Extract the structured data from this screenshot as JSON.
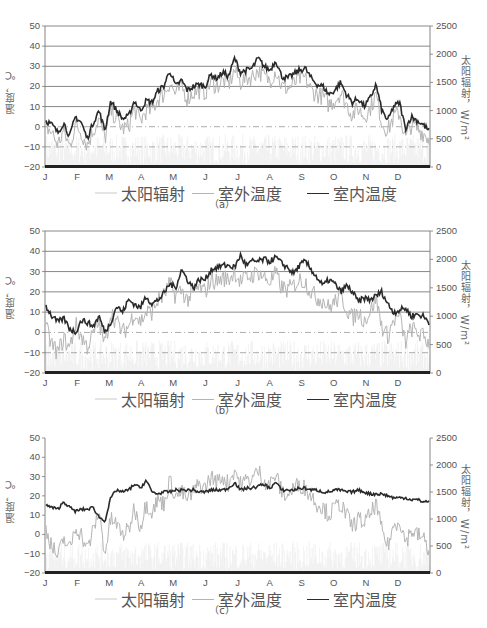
{
  "figure": {
    "months": [
      "J",
      "F",
      "M",
      "A",
      "M",
      "J",
      "J",
      "A",
      "S",
      "O",
      "N",
      "D"
    ],
    "left_axis": {
      "label": "温度，℃",
      "ticks": [
        "50",
        "40",
        "30",
        "20",
        "10",
        "0",
        "−10",
        "−20"
      ]
    },
    "right_axis": {
      "label": "太阳辐射，W/m²",
      "ticks": [
        "2500",
        "2000",
        "1500",
        "1000",
        "500",
        "0"
      ]
    },
    "legend": {
      "solar": "太阳辐射",
      "outdoor": "室外温度",
      "indoor": "室内温度"
    },
    "colors": {
      "solar": "#e4e4e4",
      "outdoor": "#b4b4b4",
      "indoor": "#2a2a2a",
      "grid": "#6a6a6a",
      "axis": "#777777"
    }
  },
  "panels": [
    {
      "caption": "（a）",
      "gridlines": true
    },
    {
      "caption": "（b）",
      "gridlines": true
    },
    {
      "caption": "（c）",
      "gridlines": false
    }
  ],
  "chart_data": [
    {
      "type": "line",
      "title": "(a)",
      "xlabel": "",
      "categories": [
        "J",
        "F",
        "M",
        "A",
        "M",
        "J",
        "J",
        "A",
        "S",
        "O",
        "N",
        "D"
      ],
      "ylabel": "温度，℃",
      "ylim": [
        -20,
        50
      ],
      "y2label": "太阳辐射，W/m²",
      "y2lim": [
        0,
        2500
      ],
      "grid": true,
      "legend_position": "bottom",
      "series": [
        {
          "name": "室内温度",
          "axis": "left",
          "values": [
            3,
            1,
            -3,
            2,
            -5,
            5,
            2,
            -6,
            2,
            8,
            -2,
            13,
            8,
            4,
            5,
            13,
            8,
            13,
            12,
            18,
            20,
            28,
            20,
            23,
            18,
            20,
            21,
            20,
            26,
            24,
            27,
            25,
            34,
            27,
            28,
            29,
            34,
            30,
            28,
            33,
            25,
            24,
            26,
            28,
            29,
            24,
            21,
            20,
            16,
            18,
            22,
            16,
            12,
            14,
            10,
            14,
            21,
            8,
            3,
            10,
            12,
            -1,
            5,
            3,
            1,
            -2
          ]
        },
        {
          "name": "室外温度",
          "axis": "left",
          "values": [
            0,
            -3,
            -9,
            -2,
            -10,
            1,
            -3,
            -9,
            -2,
            4,
            -6,
            8,
            4,
            -1,
            0,
            9,
            3,
            8,
            8,
            14,
            16,
            22,
            16,
            20,
            14,
            17,
            18,
            17,
            22,
            20,
            23,
            21,
            28,
            22,
            24,
            25,
            28,
            25,
            23,
            28,
            20,
            19,
            21,
            24,
            24,
            18,
            16,
            15,
            11,
            13,
            17,
            11,
            6,
            9,
            5,
            9,
            16,
            2,
            -2,
            5,
            7,
            -6,
            1,
            -1,
            -3,
            -6
          ]
        },
        {
          "name": "太阳辐射",
          "axis": "right",
          "approx_range": [
            0,
            600
          ]
        }
      ]
    },
    {
      "type": "line",
      "title": "(b)",
      "xlabel": "",
      "categories": [
        "J",
        "F",
        "M",
        "A",
        "M",
        "J",
        "J",
        "A",
        "S",
        "O",
        "N",
        "D"
      ],
      "ylabel": "温度，℃",
      "ylim": [
        -20,
        50
      ],
      "y2label": "太阳辐射，W/m²",
      "y2lim": [
        0,
        2500
      ],
      "grid": true,
      "legend_position": "bottom",
      "series": [
        {
          "name": "室内温度",
          "axis": "left",
          "values": [
            13,
            8,
            5,
            7,
            2,
            0,
            6,
            5,
            3,
            8,
            0,
            5,
            13,
            10,
            16,
            14,
            12,
            18,
            14,
            16,
            19,
            24,
            22,
            31,
            26,
            22,
            26,
            26,
            31,
            32,
            33,
            33,
            32,
            38,
            33,
            35,
            35,
            36,
            35,
            37,
            34,
            32,
            29,
            33,
            35,
            31,
            27,
            23,
            26,
            24,
            20,
            23,
            20,
            15,
            17,
            16,
            18,
            20,
            14,
            10,
            11,
            12,
            8,
            9,
            8,
            5
          ]
        },
        {
          "name": "室外温度",
          "axis": "left",
          "values": [
            2,
            -6,
            -10,
            -3,
            -8,
            4,
            -2,
            -7,
            -1,
            5,
            -6,
            10,
            5,
            0,
            3,
            10,
            5,
            10,
            10,
            16,
            18,
            24,
            18,
            21,
            16,
            20,
            22,
            20,
            26,
            25,
            27,
            26,
            30,
            25,
            27,
            28,
            30,
            27,
            25,
            29,
            22,
            21,
            23,
            26,
            25,
            20,
            17,
            16,
            12,
            15,
            18,
            12,
            7,
            10,
            6,
            10,
            17,
            3,
            -2,
            6,
            8,
            -5,
            2,
            0,
            -2,
            -5
          ]
        },
        {
          "name": "太阳辐射",
          "axis": "right",
          "approx_range": [
            0,
            600
          ]
        }
      ]
    },
    {
      "type": "line",
      "title": "(c)",
      "xlabel": "",
      "categories": [
        "J",
        "F",
        "M",
        "A",
        "M",
        "J",
        "J",
        "A",
        "S",
        "O",
        "N",
        "D"
      ],
      "ylabel": "温度，℃",
      "ylim": [
        -20,
        50
      ],
      "y2label": "太阳辐射，W/m²",
      "y2lim": [
        0,
        2500
      ],
      "grid": false,
      "legend_position": "bottom",
      "series": [
        {
          "name": "室内温度",
          "axis": "left",
          "values": [
            15,
            14,
            13,
            17,
            14,
            12,
            13,
            13,
            14,
            9,
            7,
            19,
            23,
            22,
            23,
            26,
            24,
            28,
            22,
            21,
            22,
            22,
            23,
            23,
            23,
            23,
            22,
            22,
            23,
            23,
            23,
            24,
            27,
            23,
            24,
            24,
            25,
            26,
            24,
            27,
            23,
            23,
            23,
            24,
            24,
            23,
            23,
            22,
            22,
            23,
            23,
            22,
            22,
            23,
            22,
            21,
            21,
            21,
            20,
            19,
            19,
            19,
            18,
            18,
            17,
            17
          ]
        },
        {
          "name": "室外温度",
          "axis": "left",
          "values": [
            3,
            -6,
            -12,
            -2,
            -8,
            4,
            0,
            -8,
            2,
            12,
            -10,
            8,
            5,
            0,
            2,
            14,
            4,
            16,
            12,
            18,
            16,
            28,
            20,
            22,
            18,
            22,
            26,
            24,
            30,
            27,
            30,
            26,
            34,
            26,
            28,
            29,
            33,
            28,
            26,
            31,
            22,
            20,
            24,
            26,
            24,
            20,
            16,
            14,
            10,
            14,
            16,
            10,
            4,
            8,
            6,
            10,
            16,
            2,
            -6,
            4,
            8,
            -4,
            2,
            0,
            -2,
            -8
          ]
        },
        {
          "name": "太阳辐射",
          "axis": "right",
          "approx_range": [
            0,
            600
          ]
        }
      ]
    }
  ]
}
